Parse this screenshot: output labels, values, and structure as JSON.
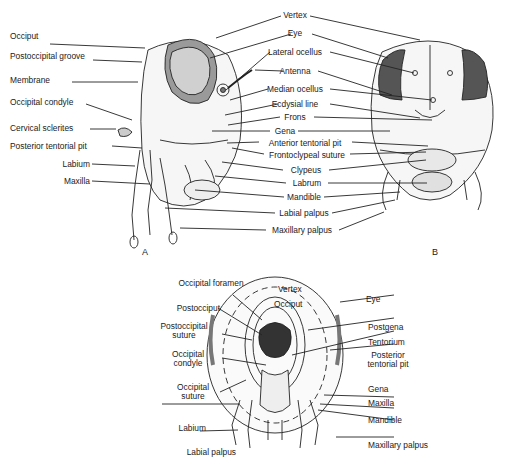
{
  "figure": {
    "panels": [
      {
        "id": "A",
        "view": "lateral head"
      },
      {
        "id": "B",
        "view": "anterior head"
      },
      {
        "id": "C",
        "view": "posterior head",
        "letter": ""
      }
    ],
    "panel_letters": {
      "A": "A",
      "B": "B"
    },
    "labels_A_left": [
      "Occiput",
      "Postoccipital groove",
      "Membrane",
      "Occipital condyle",
      "Cervical sclerites",
      "Posterior tentorial pit",
      "Labium",
      "Maxilla"
    ],
    "labels_center": [
      "Vertex",
      "Eye",
      "Lateral ocellus",
      "Antenna",
      "Median ocellus",
      "Ecdysial line",
      "Frons",
      "Gena",
      "Anterior tentorial pit",
      "Frontoclypeal suture",
      "Clypeus",
      "Labrum",
      "Mandible",
      "Labial palpus",
      "Maxillary palpus"
    ],
    "labels_bottom_left": [
      "Occipital foramen",
      "Postocciput",
      "Postoccipital suture",
      "Occipital condyle",
      "Occipital suture",
      "Labium",
      "Labial palpus"
    ],
    "labels_bottom_inner": [
      "Vertex",
      "Occiput"
    ],
    "labels_bottom_right": [
      "Eye",
      "Postgena",
      "Tentorium",
      "Posterior tentorial pit",
      "Gena",
      "Maxilla",
      "Mandible",
      "Maxillary palpus"
    ]
  }
}
